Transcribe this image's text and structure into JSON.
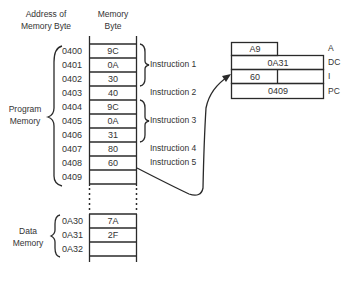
{
  "headers": {
    "address": "Address of Memory Byte",
    "address_line1": "Address of",
    "address_line2": "Memory Byte",
    "memory_line1": "Memory",
    "memory_line2": "Byte"
  },
  "program_memory": {
    "label_line1": "Program",
    "label_line2": "Memory",
    "rows": [
      {
        "address": "0400",
        "value": "9C"
      },
      {
        "address": "0401",
        "value": "0A"
      },
      {
        "address": "0402",
        "value": "30"
      },
      {
        "address": "0403",
        "value": "40"
      },
      {
        "address": "0404",
        "value": "9C"
      },
      {
        "address": "0405",
        "value": "0A"
      },
      {
        "address": "0406",
        "value": "31"
      },
      {
        "address": "0407",
        "value": "80"
      },
      {
        "address": "0408",
        "value": "60"
      },
      {
        "address": "0409",
        "value": ""
      }
    ]
  },
  "instructions": [
    {
      "label": "Instruction 1",
      "rows": [
        "0400",
        "0401",
        "0402"
      ]
    },
    {
      "label": "Instruction 2",
      "rows": [
        "0403"
      ]
    },
    {
      "label": "Instruction 3",
      "rows": [
        "0404",
        "0405",
        "0406"
      ]
    },
    {
      "label": "Instruction 4",
      "rows": [
        "0407"
      ]
    },
    {
      "label": "Instruction 5",
      "rows": [
        "0408"
      ]
    }
  ],
  "data_memory": {
    "label_line1": "Data",
    "label_line2": "Memory",
    "rows": [
      {
        "address": "0A30",
        "value": "7A"
      },
      {
        "address": "0A31",
        "value": "2F"
      },
      {
        "address": "0A32",
        "value": ""
      }
    ]
  },
  "registers": [
    {
      "name": "A",
      "value": "A9"
    },
    {
      "name": "DC",
      "value": "0A31"
    },
    {
      "name": "I",
      "value": "60"
    },
    {
      "name": "PC",
      "value": "0409"
    }
  ],
  "colors": {
    "ink": "#2a2a2a",
    "background": "#ffffff"
  }
}
